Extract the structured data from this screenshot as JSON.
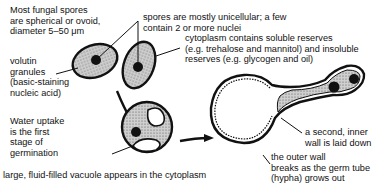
{
  "diagram": {
    "labels": {
      "spores_shape": [
        "Most fungal spores",
        "are spherical or ovoid,",
        "diameter 5–50 μm"
      ],
      "nuclei": [
        "spores are mostly unicellular; a few",
        "contain 2 or more nuclei"
      ],
      "cytoplasm": [
        "cytoplasm contains soluble reserves",
        "(e.g. trehalose and mannitol) and insoluble",
        "reserves (e.g. glycogen and oil)"
      ],
      "volutin": [
        "volutin",
        "granules",
        "(basic-staining",
        "nucleic acid)"
      ],
      "water_uptake": [
        "Water uptake",
        "is the first",
        "stage of",
        "germination"
      ],
      "vacuole": [
        "large, fluid-filled vacuole appears in the cytoplasm"
      ],
      "inner_wall": [
        "a second, inner",
        "wall is laid down"
      ],
      "outer_wall": [
        "the outer wall",
        "breaks as the germ tube",
        "(hypha) grows out"
      ]
    },
    "colors": {
      "ink": "#111111",
      "cytoplasm_fill": "#bdbdbd",
      "background": "#ffffff"
    }
  }
}
